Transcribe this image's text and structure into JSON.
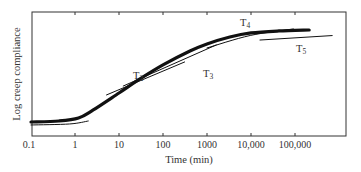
{
  "chart_data": {
    "type": "line",
    "title": "",
    "xlabel": "Time (min)",
    "ylabel": "Log creep compliance",
    "x_scale": "log",
    "xlim": [
      0.1,
      1000000
    ],
    "ylim": [
      0,
      10
    ],
    "y_units": "relative (no tick labels)",
    "grid": false,
    "legend": "none (curves labeled inline)",
    "x_ticks": [
      {
        "value": 0.1,
        "label": "0.1"
      },
      {
        "value": 1,
        "label": "1"
      },
      {
        "value": 10,
        "label": "10"
      },
      {
        "value": 100,
        "label": "100"
      },
      {
        "value": 1000,
        "label": "1000"
      },
      {
        "value": 10000,
        "label": "10,000"
      },
      {
        "value": 100000,
        "label": "100,000"
      }
    ],
    "series": [
      {
        "name": "Master curve",
        "style": "thick",
        "x": [
          0.1,
          0.43,
          1.2,
          2.6,
          10,
          30,
          100,
          410,
          1000,
          3300,
          10000,
          43000,
          210000
        ],
        "y": [
          1.13,
          1.21,
          1.45,
          2.1,
          3.47,
          4.6,
          5.73,
          6.85,
          7.42,
          7.98,
          8.31,
          8.47,
          8.55
        ]
      },
      {
        "name": "T1",
        "label_visible": false,
        "style": "thin",
        "x": [
          0.1,
          2.0
        ],
        "y": [
          0.89,
          1.21
        ]
      },
      {
        "name": "T2",
        "label": {
          "text": "T",
          "sub": "2"
        },
        "style": "thin",
        "x": [
          5.2,
          310
        ],
        "y": [
          3.31,
          5.97
        ]
      },
      {
        "name": "T3",
        "label": {
          "text": "T",
          "sub": "3"
        },
        "style": "thin",
        "x": [
          12.5,
          1620
        ],
        "y": [
          4.03,
          7.34
        ]
      },
      {
        "name": "T4",
        "label": {
          "text": "T",
          "sub": "4"
        },
        "style": "thin",
        "x": [
          1000,
          92000
        ],
        "y": [
          7.1,
          8.63
        ]
      },
      {
        "name": "T5",
        "label": {
          "text": "T",
          "sub": "5"
        },
        "style": "thin",
        "x": [
          16000,
          700000
        ],
        "y": [
          7.74,
          8.1
        ]
      }
    ]
  }
}
